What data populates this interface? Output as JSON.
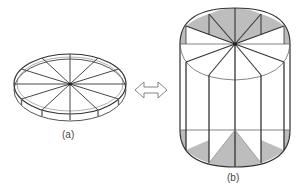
{
  "figure": {
    "panel_a": {
      "label": "(a)",
      "description": "flat disk divided into 12 radial sectors, shown in perspective"
    },
    "arrow": {
      "icon": "double-arrow-icon",
      "description": "bidirectional hollow arrow indicating transformation"
    },
    "panel_b": {
      "label": "(b)",
      "description": "cylinder with 12 sectors on top face, vertical edges, shaded triangular regions on top and bottom"
    },
    "colors": {
      "line": "#333333",
      "shade": "#bdbdbd",
      "background": "#ffffff"
    }
  }
}
